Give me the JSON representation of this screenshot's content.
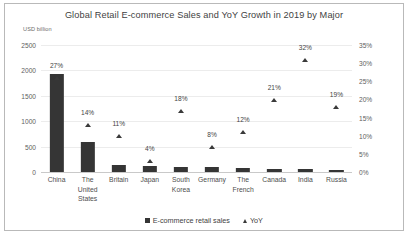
{
  "chart_data": {
    "type": "bar",
    "title": "Global Retail E-commerce Sales and YoY Growth in 2019 by Major",
    "xlabel": "",
    "ylabel": "USD billion",
    "y2label": "",
    "ylim": [
      0,
      2500
    ],
    "y2lim": [
      0,
      35
    ],
    "yticks": [
      "0",
      "500",
      "1000",
      "1500",
      "2000",
      "2500"
    ],
    "ytick_values": [
      0,
      500,
      1000,
      1500,
      2000,
      2500
    ],
    "y2ticks": [
      "0%",
      "5%",
      "10%",
      "15%",
      "20%",
      "25%",
      "30%",
      "35%"
    ],
    "y2tick_values": [
      0,
      5,
      10,
      15,
      20,
      25,
      30,
      35
    ],
    "grid": true,
    "legend_position": "bottom-center",
    "categories": [
      "China",
      "The United States",
      "Britain",
      "Japan",
      "South Korea",
      "Germany",
      "The French",
      "Canada",
      "India",
      "Russia"
    ],
    "series": [
      {
        "name": "E-commerce retail sales",
        "type": "bar",
        "axis": "left",
        "unit": "USD billion",
        "values": [
          1935,
          587,
          142,
          115,
          104,
          94,
          80,
          65,
          55,
          32
        ]
      },
      {
        "name": "YoY",
        "type": "scatter",
        "axis": "right",
        "unit": "%",
        "values": [
          27,
          14,
          11,
          4,
          18,
          8,
          12,
          21,
          32,
          19
        ],
        "labels": [
          "27%",
          "14%",
          "11%",
          "4%",
          "18%",
          "8%",
          "12%",
          "21%",
          "32%",
          "19%"
        ]
      }
    ]
  },
  "legend": {
    "items": [
      {
        "label": "E-commerce retail sales",
        "marker": "square-marker"
      },
      {
        "label": "YoY",
        "marker": "triangle-marker"
      }
    ]
  },
  "colors": {
    "bar": "#353535",
    "marker": "#3a3a3a",
    "grid": "#ececec",
    "axis": "#c9c9c9",
    "text": "#4a4a4a",
    "border": "#b9b9b9",
    "background": "#ffffff"
  }
}
